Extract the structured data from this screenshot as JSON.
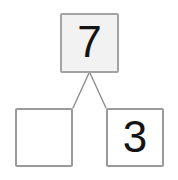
{
  "diagram": {
    "kind": "number-bond",
    "background_color": "#ffffff",
    "box_border_color": "#9a9a9a",
    "total_fill_color": "#f2f2f2",
    "part_fill_color": "#ffffff",
    "connector_color": "#8d8d8d",
    "digit_color": "#141414"
  },
  "total": {
    "label": "7",
    "name": "whole-box"
  },
  "parts": [
    {
      "label": "",
      "name": "part-box-left",
      "filled": false
    },
    {
      "label": "3",
      "name": "part-box-right",
      "filled": true
    }
  ],
  "connectors": [
    {
      "name": "connector-left",
      "from_x": 89,
      "from_y": 73,
      "to_x": 73,
      "to_y": 108
    },
    {
      "name": "connector-right",
      "from_x": 90,
      "from_y": 73,
      "to_x": 106,
      "to_y": 108
    }
  ]
}
